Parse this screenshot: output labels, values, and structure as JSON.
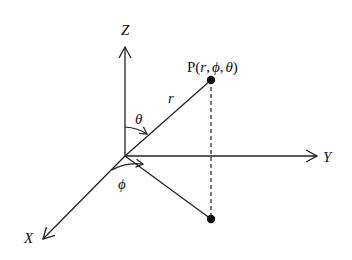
{
  "diagram": {
    "type": "spherical-coordinate-system",
    "axes": {
      "z": {
        "label": "Z"
      },
      "y": {
        "label": "Y"
      },
      "x": {
        "label": "X"
      }
    },
    "point": {
      "prefix": "P(",
      "r": "r",
      "comma1": ",",
      "phi": "ϕ",
      "comma2": ",",
      "theta": "θ",
      "suffix": ")"
    },
    "labels": {
      "radius": "r",
      "polar_angle": "θ",
      "azimuth_angle": "ϕ"
    },
    "colors": {
      "line": "#222222",
      "background": "#ffffff"
    }
  }
}
